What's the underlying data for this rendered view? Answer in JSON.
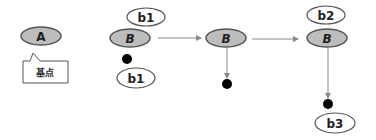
{
  "diagram": {
    "colors": {
      "node_fill": "#bdbdbd",
      "node_stroke": "#555555",
      "bubble_fill": "#ffffff",
      "edge": "#888888",
      "dot": "#000000"
    },
    "base_node": {
      "label": "A",
      "callout": "基点"
    },
    "nodes": [
      {
        "id": "b-node-1",
        "label": "B",
        "top_bubble": "b1",
        "bottom_bubble": "b1"
      },
      {
        "id": "b-node-2",
        "label": "B"
      },
      {
        "id": "b-node-3",
        "label": "B",
        "top_bubble": "b2",
        "bottom_bubble": "b3"
      }
    ],
    "edges": [
      {
        "from": "b-node-1",
        "to": "b-node-2"
      },
      {
        "from": "b-node-2",
        "to": "b-node-3"
      },
      {
        "from": "b-node-2",
        "to": "dot-2"
      },
      {
        "from": "b-node-3",
        "to": "dot-3"
      }
    ]
  }
}
